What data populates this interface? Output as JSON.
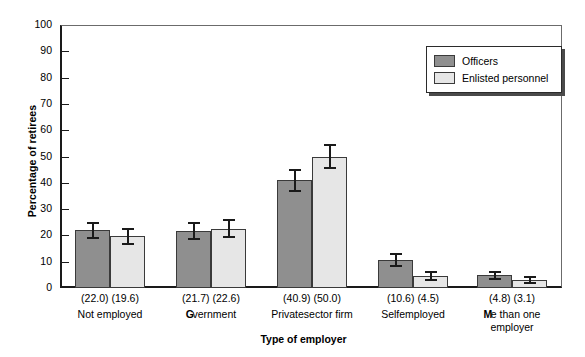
{
  "chart_data": {
    "type": "bar",
    "title": "",
    "xlabel": "Type of employer",
    "ylabel": "Percentage of retirees",
    "ylim": [
      0,
      100
    ],
    "yticks": [
      0,
      10,
      20,
      30,
      40,
      50,
      60,
      70,
      80,
      90,
      100
    ],
    "grid": false,
    "legend_position": "top-right",
    "categories": [
      "Not employed",
      "Government",
      "Private sector firm",
      "Self-employed",
      "More than one employer"
    ],
    "category_labels_rendered": [
      "Not employed",
      "Gvernment",
      "Privatesector firm",
      "Selfemployed",
      "Me than one employer"
    ],
    "series": [
      {
        "name": "Officers",
        "color": "#8f8f8f",
        "values": [
          22.0,
          21.7,
          40.9,
          10.6,
          4.8
        ],
        "errors": [
          3.2,
          3.3,
          4.5,
          2.6,
          1.8
        ]
      },
      {
        "name": "Enlisted personnel",
        "color": "#e6e6e6",
        "values": [
          19.6,
          22.6,
          50.0,
          4.5,
          3.1
        ],
        "errors": [
          3.4,
          3.6,
          4.6,
          1.9,
          1.5
        ]
      }
    ],
    "value_labels": [
      [
        "(22.0)",
        "(19.6)"
      ],
      [
        "(21.7)",
        "(22.6)"
      ],
      [
        "(40.9)",
        "(50.0)"
      ],
      [
        "(10.6)",
        "(4.5)"
      ],
      [
        "(4.8)",
        "(3.1)"
      ]
    ]
  },
  "legend": {
    "items": [
      {
        "label": "Officers",
        "color": "#8f8f8f"
      },
      {
        "label": "Enlisted personnel",
        "color": "#e6e6e6"
      }
    ]
  },
  "axes": {
    "y_title": "Percentage of retirees",
    "x_title": "Type of employer",
    "y_tick_labels": [
      "100",
      "90",
      "80",
      "70",
      "60",
      "50",
      "40",
      "30",
      "20",
      "10",
      "0"
    ]
  },
  "colors": {
    "officers": "#8f8f8f",
    "enlisted": "#e6e6e6",
    "axis": "#1a1a1a",
    "background": "#ffffff"
  }
}
